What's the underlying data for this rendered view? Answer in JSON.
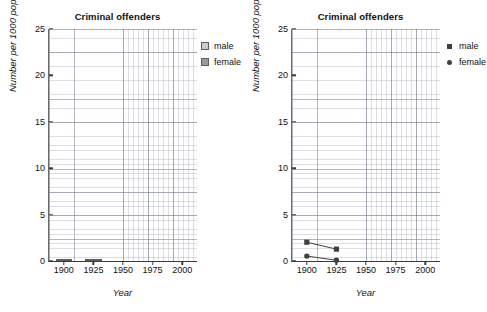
{
  "figure": {
    "panels": [
      {
        "id": "left",
        "title": "Criminal offenders",
        "xlabel": "Year",
        "ylabel": "Number per 1000 population",
        "legend": [
          {
            "label": "male",
            "color": "#cccccc",
            "marker": "square-swatch"
          },
          {
            "label": "female",
            "color": "#999999",
            "marker": "square-swatch"
          }
        ]
      },
      {
        "id": "right",
        "title": "Criminal offenders",
        "xlabel": "Year",
        "ylabel": "Number per 1000 population",
        "legend": [
          {
            "label": "male",
            "color": "#3f3f3f",
            "marker": "square-point"
          },
          {
            "label": "female",
            "color": "#3f3f3f",
            "marker": "circle-point"
          }
        ]
      }
    ],
    "yticks": [
      "0",
      "5",
      "10",
      "15",
      "20",
      "25"
    ],
    "xticks": [
      "1900",
      "1925",
      "1950",
      "1975",
      "2000"
    ]
  },
  "chart_data": [
    {
      "type": "bar",
      "title": "Criminal offenders",
      "xlabel": "Year",
      "ylabel": "Number per 1000 population",
      "stacked": true,
      "categories": [
        1900,
        1925
      ],
      "x": [
        1900,
        1925
      ],
      "xlim": [
        1887.5,
        2012.5
      ],
      "ylim": [
        0,
        25
      ],
      "yticks": [
        0,
        5,
        10,
        15,
        20,
        25
      ],
      "xticks": [
        1900,
        1925,
        1950,
        1975,
        2000
      ],
      "grid": true,
      "legend_position": "outside-top-right",
      "series": [
        {
          "name": "male",
          "values": [
            2.0,
            1.25
          ],
          "color": "#cccccc"
        },
        {
          "name": "female",
          "values": [
            0.5,
            0.05
          ],
          "color": "#999999"
        }
      ],
      "bar_totals": [
        2.5,
        1.3
      ]
    },
    {
      "type": "line",
      "title": "Criminal offenders",
      "xlabel": "Year",
      "ylabel": "Number per 1000 population",
      "x": [
        1900,
        1925
      ],
      "xlim": [
        1887.5,
        2012.5
      ],
      "ylim": [
        0,
        25
      ],
      "yticks": [
        0,
        5,
        10,
        15,
        20,
        25
      ],
      "xticks": [
        1900,
        1925,
        1950,
        1975,
        2000
      ],
      "grid": true,
      "legend_position": "outside-top-right",
      "series": [
        {
          "name": "male",
          "values": [
            2.0,
            1.25
          ],
          "color": "#3f3f3f",
          "marker": "square"
        },
        {
          "name": "female",
          "values": [
            0.5,
            0.05
          ],
          "color": "#3f3f3f",
          "marker": "circle"
        }
      ]
    }
  ]
}
